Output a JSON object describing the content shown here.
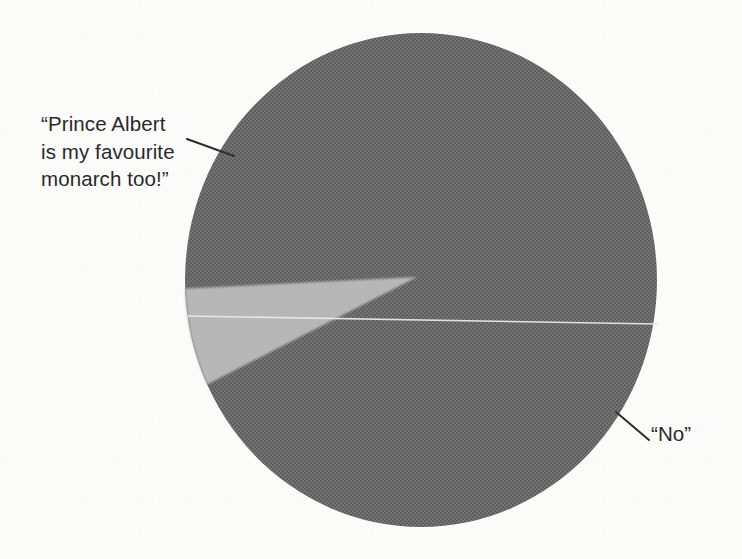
{
  "figure": {
    "background_color": "#fbfbfa",
    "ink_color": "#2a2a2a"
  },
  "chart_data": {
    "type": "pie",
    "title": "",
    "subtitle": "",
    "xlabel": "",
    "ylabel": "",
    "grid": false,
    "legend_position": "none",
    "labels_position": "callout-annotations",
    "center": {
      "x": 421,
      "y": 280
    },
    "radius": {
      "x": 236,
      "y": 247
    },
    "start_angle_deg": 177,
    "direction": "counterclockwise",
    "categories": [
      "“No”",
      "“Prince Albert is my favourite monarch too!”"
    ],
    "values": [
      97,
      3
    ],
    "value_unit": "percent",
    "slices": [
      {
        "name": "no-slice",
        "label": "“No”",
        "value": 97,
        "color": "#6e6e6e",
        "start_angle_deg": 205,
        "end_angle_deg": 182
      },
      {
        "name": "prince-albert-slice",
        "label": "“Prince Albert is my favourite monarch too!”",
        "value": 3,
        "color": "#b9b9b9",
        "start_angle_deg": 182,
        "end_angle_deg": 205
      }
    ],
    "divider_line": {
      "name": "slice-divider",
      "color": "#e8e8e6",
      "from": {
        "x": 185,
        "y": 316
      },
      "to": {
        "x": 658,
        "y": 324
      }
    }
  },
  "annotations": [
    {
      "name": "prince-albert-callout",
      "text": "“Prince Albert\nis my favourite\nmonarch too!”",
      "leader": {
        "x1": 187,
        "y1": 139,
        "x2": 234,
        "y2": 156
      }
    },
    {
      "name": "no-callout",
      "text": "“No”",
      "leader": {
        "x1": 616,
        "y1": 412,
        "x2": 649,
        "y2": 440
      }
    }
  ],
  "labels": {
    "prince_albert": "“Prince Albert\nis my favourite\nmonarch too!”",
    "no": "“No”"
  },
  "colors": {
    "slice_major": "#6e6e6e",
    "slice_minor": "#b9b9b9",
    "divider": "#e8e8e6",
    "leader_line": "#2f2f2f",
    "background": "#fbfbfa",
    "text": "#2a2a2a"
  }
}
